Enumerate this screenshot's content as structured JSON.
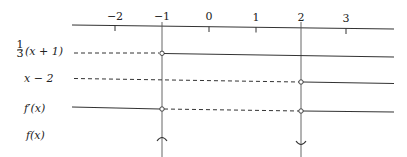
{
  "diagram": {
    "type": "sign-chart",
    "axis": {
      "ticks": [
        {
          "value": -2,
          "label": "−2"
        },
        {
          "value": -1,
          "label": "−1"
        },
        {
          "value": 0,
          "label": "0"
        },
        {
          "value": 1,
          "label": "1"
        },
        {
          "value": 2,
          "label": "2"
        },
        {
          "value": 3,
          "label": "3"
        }
      ]
    },
    "rows": [
      {
        "label": "⅓(x + 1)",
        "label_frac": "1/3",
        "segments": [
          {
            "from": "-inf",
            "to": -1,
            "sign": "negative",
            "style": "dashed"
          },
          {
            "from": -1,
            "to": "inf",
            "sign": "positive",
            "style": "solid"
          }
        ],
        "zero_at": [
          -1
        ]
      },
      {
        "label": "x − 2",
        "segments": [
          {
            "from": "-inf",
            "to": 2,
            "sign": "negative",
            "style": "dashed"
          },
          {
            "from": 2,
            "to": "inf",
            "sign": "positive",
            "style": "solid"
          }
        ],
        "zero_at": [
          2
        ]
      },
      {
        "label": "f′(x)",
        "segments": [
          {
            "from": "-inf",
            "to": -1,
            "sign": "positive",
            "style": "solid"
          },
          {
            "from": -1,
            "to": 2,
            "sign": "negative",
            "style": "dashed"
          },
          {
            "from": 2,
            "to": "inf",
            "sign": "positive",
            "style": "solid"
          }
        ],
        "zero_at": [
          -1,
          2
        ]
      },
      {
        "label": "f(x)",
        "markers": [
          {
            "at": -1,
            "type": "local-maximum"
          },
          {
            "at": 2,
            "type": "local-minimum"
          }
        ]
      }
    ],
    "labels": {
      "row1_num": "1",
      "row1_den": "3",
      "row1_rest": "(x + 1)",
      "row2": "x − 2",
      "row3": "f′(x)",
      "row4": "f(x)"
    }
  }
}
